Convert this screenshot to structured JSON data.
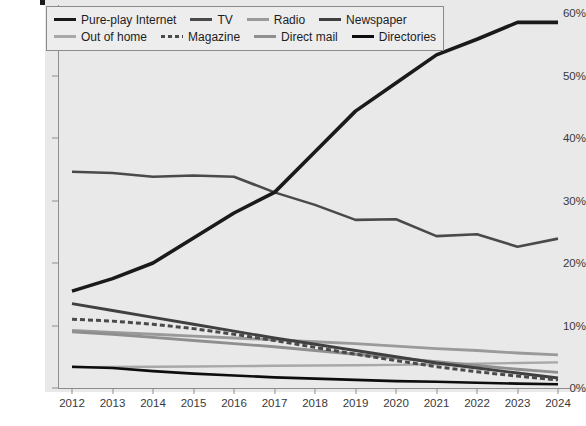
{
  "chart_data": {
    "type": "line",
    "title": "",
    "xlabel": "",
    "ylabel": "",
    "x": [
      2012,
      2013,
      2014,
      2015,
      2016,
      2017,
      2018,
      2019,
      2020,
      2021,
      2022,
      2023,
      2024
    ],
    "xtick_labels": [
      "2012",
      "2013",
      "2014",
      "2015",
      "2016",
      "2017",
      "2018",
      "2019",
      "2020",
      "2021",
      "2022",
      "2023",
      "2024"
    ],
    "ytick_labels": [
      "0%",
      "10%",
      "20%",
      "30%",
      "40%",
      "50%",
      "60%"
    ],
    "ytick_values": [
      0,
      10,
      20,
      30,
      40,
      50,
      60
    ],
    "ylim": [
      0,
      60
    ],
    "xlim": [
      2012,
      2024
    ],
    "grid": false,
    "legend_position": "top-left",
    "series": [
      {
        "name": "Pure-play Internet",
        "color": "#1a1a1a",
        "width": 3.6,
        "dash": "",
        "values": [
          15.5,
          17.5,
          20.0,
          24.0,
          28.0,
          31.3,
          37.8,
          44.3,
          48.8,
          53.3,
          55.8,
          58.5,
          58.5
        ]
      },
      {
        "name": "TV",
        "color": "#4a4a4a",
        "width": 2.6,
        "dash": "",
        "values": [
          34.6,
          34.4,
          33.8,
          34.0,
          33.8,
          31.3,
          29.3,
          26.9,
          27.0,
          24.3,
          24.6,
          22.6,
          23.9
        ]
      },
      {
        "name": "Radio",
        "color": "#9a9a9a",
        "width": 2.8,
        "dash": "",
        "values": [
          9.2,
          8.9,
          8.6,
          8.3,
          8.0,
          7.7,
          7.4,
          7.1,
          6.7,
          6.3,
          6.0,
          5.6,
          5.3
        ]
      },
      {
        "name": "Newspaper",
        "color": "#404040",
        "width": 2.8,
        "dash": "",
        "values": [
          13.5,
          12.4,
          11.3,
          10.2,
          9.1,
          8.0,
          7.0,
          6.0,
          5.0,
          4.0,
          3.2,
          2.4,
          1.6
        ]
      },
      {
        "name": "Out of home",
        "color": "#a8a8a8",
        "width": 2.4,
        "dash": "",
        "values": [
          3.3,
          3.35,
          3.4,
          3.45,
          3.5,
          3.55,
          3.6,
          3.65,
          3.7,
          3.8,
          3.9,
          4.0,
          4.1
        ]
      },
      {
        "name": "Magazine",
        "color": "#4a4a4a",
        "width": 3.0,
        "dash": "5 3",
        "values": [
          11.0,
          10.7,
          10.2,
          9.5,
          8.6,
          7.6,
          6.5,
          5.4,
          4.4,
          3.4,
          2.6,
          1.9,
          1.3
        ]
      },
      {
        "name": "Direct mail",
        "color": "#8f8f8f",
        "width": 2.8,
        "dash": "",
        "values": [
          9.0,
          8.6,
          8.1,
          7.6,
          7.1,
          6.6,
          6.0,
          5.4,
          4.8,
          4.2,
          3.6,
          3.0,
          2.5
        ]
      },
      {
        "name": "Directories",
        "color": "#0d0d0d",
        "width": 2.6,
        "dash": "",
        "values": [
          3.4,
          3.2,
          2.7,
          2.3,
          2.0,
          1.7,
          1.5,
          1.3,
          1.1,
          1.0,
          0.85,
          0.7,
          0.6
        ]
      }
    ]
  },
  "legend": {
    "rows": [
      [
        "Pure-play Internet",
        "TV",
        "Radio",
        "Newspaper"
      ],
      [
        "Out of home",
        "Magazine",
        "Direct mail",
        "Directories"
      ]
    ]
  }
}
